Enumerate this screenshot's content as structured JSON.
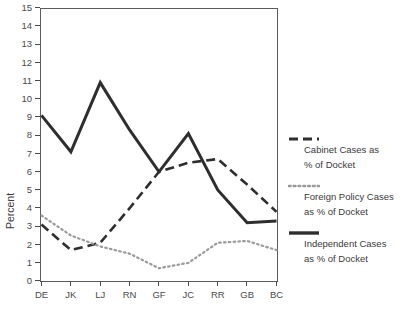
{
  "chart_data": {
    "type": "line",
    "title": "",
    "xlabel": "",
    "ylabel": "Percent",
    "categories": [
      "DE",
      "JK",
      "LJ",
      "RN",
      "GF",
      "JC",
      "RR",
      "GB",
      "BC"
    ],
    "ylim": [
      0,
      15
    ],
    "ytick_step": 1,
    "yticks": [
      0,
      1,
      2,
      3,
      4,
      5,
      6,
      7,
      8,
      9,
      10,
      11,
      12,
      13,
      14,
      15
    ],
    "grid": false,
    "legend_position": "right",
    "series": [
      {
        "name": "Cabinet Cases as % of Docket",
        "style": "dashed",
        "color": "#2e2e2e",
        "values": [
          3.1,
          1.7,
          2.1,
          4.0,
          6.0,
          6.5,
          6.7,
          5.3,
          3.8
        ]
      },
      {
        "name": "Foreign Policy Cases as % of Docket",
        "style": "dotted",
        "color": "#9a9a9a",
        "values": [
          3.6,
          2.5,
          1.9,
          1.5,
          0.7,
          1.0,
          2.1,
          2.2,
          1.7
        ]
      },
      {
        "name": "Independent Cases as % of Docket",
        "style": "solid",
        "color": "#2e2e2e",
        "values": [
          9.1,
          7.1,
          10.9,
          8.3,
          6.0,
          8.1,
          5.0,
          3.2,
          3.3
        ]
      }
    ]
  },
  "legend": {
    "entries": [
      {
        "swatch": "dashed-line-swatch",
        "line1": "Cabinet Cases as",
        "line2": "% of Docket"
      },
      {
        "swatch": "dotted-line-swatch",
        "line1": "Foreign Policy Cases",
        "line2": "as % of Docket"
      },
      {
        "swatch": "solid-line-swatch",
        "line1": "Independent Cases",
        "line2": "as % of Docket"
      }
    ]
  },
  "axis": {
    "y_title": "Percent"
  }
}
